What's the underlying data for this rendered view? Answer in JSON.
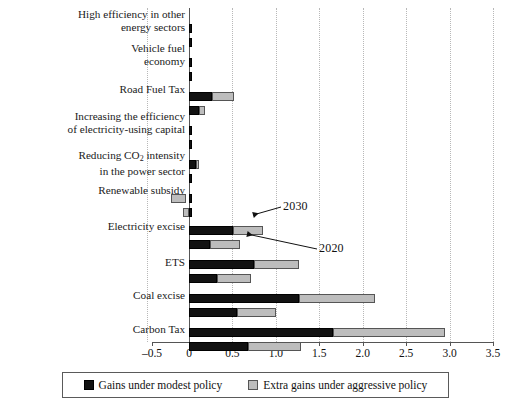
{
  "chart_data": {
    "type": "bar",
    "orientation": "horizontal",
    "title": "",
    "subtitle": "",
    "xlabel": "",
    "ylabel": "",
    "xlim": [
      -0.5,
      3.5
    ],
    "xticks": [
      "–0.5",
      "0",
      "0.5",
      "1.0",
      "1.5",
      "2.0",
      "2.5",
      "3.0",
      "3.5"
    ],
    "xtick_values": [
      -0.5,
      0,
      0.5,
      1.0,
      1.5,
      2.0,
      2.5,
      3.0,
      3.5
    ],
    "grid": "vertical dotted gridlines at every 0.5",
    "legend_position": "bottom-center, boxed",
    "categories": [
      "High efficiency in other energy sectors",
      "Vehicle fuel economy",
      "Road Fuel Tax",
      "Increasing the efficiency of electricity-using capital",
      "Reducing CO₂ intensity in the power sector",
      "Renewable subsidy",
      "Electricity excise",
      "ETS",
      "Coal excise",
      "Carbon Tax"
    ],
    "category_lines": [
      [
        "High efficiency in other",
        "energy sectors"
      ],
      [
        "Vehicle fuel",
        "economy"
      ],
      [
        "Road Fuel Tax"
      ],
      [
        "Increasing the efficiency",
        "of electricity-using capital"
      ],
      [
        "Reducing CO₂ intensity",
        "in the power sector"
      ],
      [
        "Renewable subsidy"
      ],
      [
        "Electricity excise"
      ],
      [
        "ETS"
      ],
      [
        "Coal excise"
      ],
      [
        "Carbon Tax"
      ]
    ],
    "series": [
      {
        "name": "Gains under modest policy",
        "color": "#121212",
        "scenario_2030": [
          0.01,
          0.01,
          0.26,
          0.01,
          0.08,
          0.01,
          0.51,
          0.75,
          1.27,
          1.66
        ],
        "scenario_2020": [
          0.01,
          0.01,
          0.11,
          0.01,
          0.02,
          0.0,
          0.24,
          0.32,
          0.55,
          0.68
        ]
      },
      {
        "name": "Extra gains under aggressive policy",
        "color": "#bdbdbd",
        "scenario_2030": [
          0.0,
          0.0,
          0.26,
          0.0,
          0.03,
          -0.21,
          0.34,
          0.52,
          0.87,
          1.29
        ],
        "scenario_2020": [
          0.0,
          0.0,
          0.08,
          0.0,
          0.0,
          -0.06,
          0.35,
          0.39,
          0.45,
          0.61
        ]
      }
    ],
    "bars": [
      {
        "category": "High efficiency in other energy sectors",
        "scenario": "2030",
        "dark_start": 0.0,
        "dark_end": 0.012,
        "light_start": 0.012,
        "light_end": 0.012
      },
      {
        "category": "High efficiency in other energy sectors",
        "scenario": "2020",
        "dark_start": 0.0,
        "dark_end": 0.012,
        "light_start": 0.012,
        "light_end": 0.012
      },
      {
        "category": "Vehicle fuel economy",
        "scenario": "2030",
        "dark_start": 0.0,
        "dark_end": 0.012,
        "light_start": 0.012,
        "light_end": 0.012
      },
      {
        "category": "Vehicle fuel economy",
        "scenario": "2020",
        "dark_start": 0.0,
        "dark_end": 0.012,
        "light_start": 0.012,
        "light_end": 0.012
      },
      {
        "category": "Road Fuel Tax",
        "scenario": "2030",
        "dark_start": 0.0,
        "dark_end": 0.26,
        "light_start": 0.26,
        "light_end": 0.52
      },
      {
        "category": "Road Fuel Tax",
        "scenario": "2020",
        "dark_start": 0.0,
        "dark_end": 0.11,
        "light_start": 0.11,
        "light_end": 0.19
      },
      {
        "category": "Increasing the efficiency of electricity-using capital",
        "scenario": "2030",
        "dark_start": 0.0,
        "dark_end": 0.012,
        "light_start": 0.012,
        "light_end": 0.012
      },
      {
        "category": "Increasing the efficiency of electricity-using capital",
        "scenario": "2020",
        "dark_start": 0.0,
        "dark_end": 0.012,
        "light_start": 0.012,
        "light_end": 0.012
      },
      {
        "category": "Reducing CO₂ intensity in the power sector",
        "scenario": "2030",
        "dark_start": 0.0,
        "dark_end": 0.075,
        "light_start": 0.075,
        "light_end": 0.11
      },
      {
        "category": "Reducing CO₂ intensity in the power sector",
        "scenario": "2020",
        "dark_start": 0.0,
        "dark_end": 0.02,
        "light_start": 0.02,
        "light_end": 0.02
      },
      {
        "category": "Renewable subsidy",
        "scenario": "2030",
        "dark_start": 0.0,
        "dark_end": 0.025,
        "light_start": -0.21,
        "light_end": -0.03
      },
      {
        "category": "Renewable subsidy",
        "scenario": "2020",
        "dark_start": 0.0,
        "dark_end": 0.0,
        "light_start": -0.065,
        "light_end": 0.0
      },
      {
        "category": "Electricity excise",
        "scenario": "2030",
        "dark_start": 0.0,
        "dark_end": 0.51,
        "light_start": 0.51,
        "light_end": 0.85
      },
      {
        "category": "Electricity excise",
        "scenario": "2020",
        "dark_start": 0.0,
        "dark_end": 0.24,
        "light_start": 0.24,
        "light_end": 0.59
      },
      {
        "category": "ETS",
        "scenario": "2030",
        "dark_start": 0.0,
        "dark_end": 0.75,
        "light_start": 0.75,
        "light_end": 1.27
      },
      {
        "category": "ETS",
        "scenario": "2020",
        "dark_start": 0.0,
        "dark_end": 0.32,
        "light_start": 0.32,
        "light_end": 0.71
      },
      {
        "category": "Coal excise",
        "scenario": "2030",
        "dark_start": 0.0,
        "dark_end": 1.27,
        "light_start": 1.27,
        "light_end": 2.14
      },
      {
        "category": "Coal excise",
        "scenario": "2020",
        "dark_start": 0.0,
        "dark_end": 0.55,
        "light_start": 0.55,
        "light_end": 1.0
      },
      {
        "category": "Carbon Tax",
        "scenario": "2030",
        "dark_start": 0.0,
        "dark_end": 1.66,
        "light_start": 1.66,
        "light_end": 2.95
      },
      {
        "category": "Carbon Tax",
        "scenario": "2020",
        "dark_start": 0.0,
        "dark_end": 0.68,
        "light_start": 0.68,
        "light_end": 1.29
      }
    ],
    "annotations": [
      {
        "label": "2030",
        "points_to": "upper bar of Electricity excise group"
      },
      {
        "label": "2020",
        "points_to": "lower bar of Electricity excise group"
      }
    ]
  },
  "legend": {
    "items": [
      {
        "label": "Gains under modest policy",
        "swatch": "dark"
      },
      {
        "label": "Extra gains under aggressive policy",
        "swatch": "light"
      }
    ]
  },
  "annotations": {
    "upper": "2030",
    "lower": "2020"
  }
}
